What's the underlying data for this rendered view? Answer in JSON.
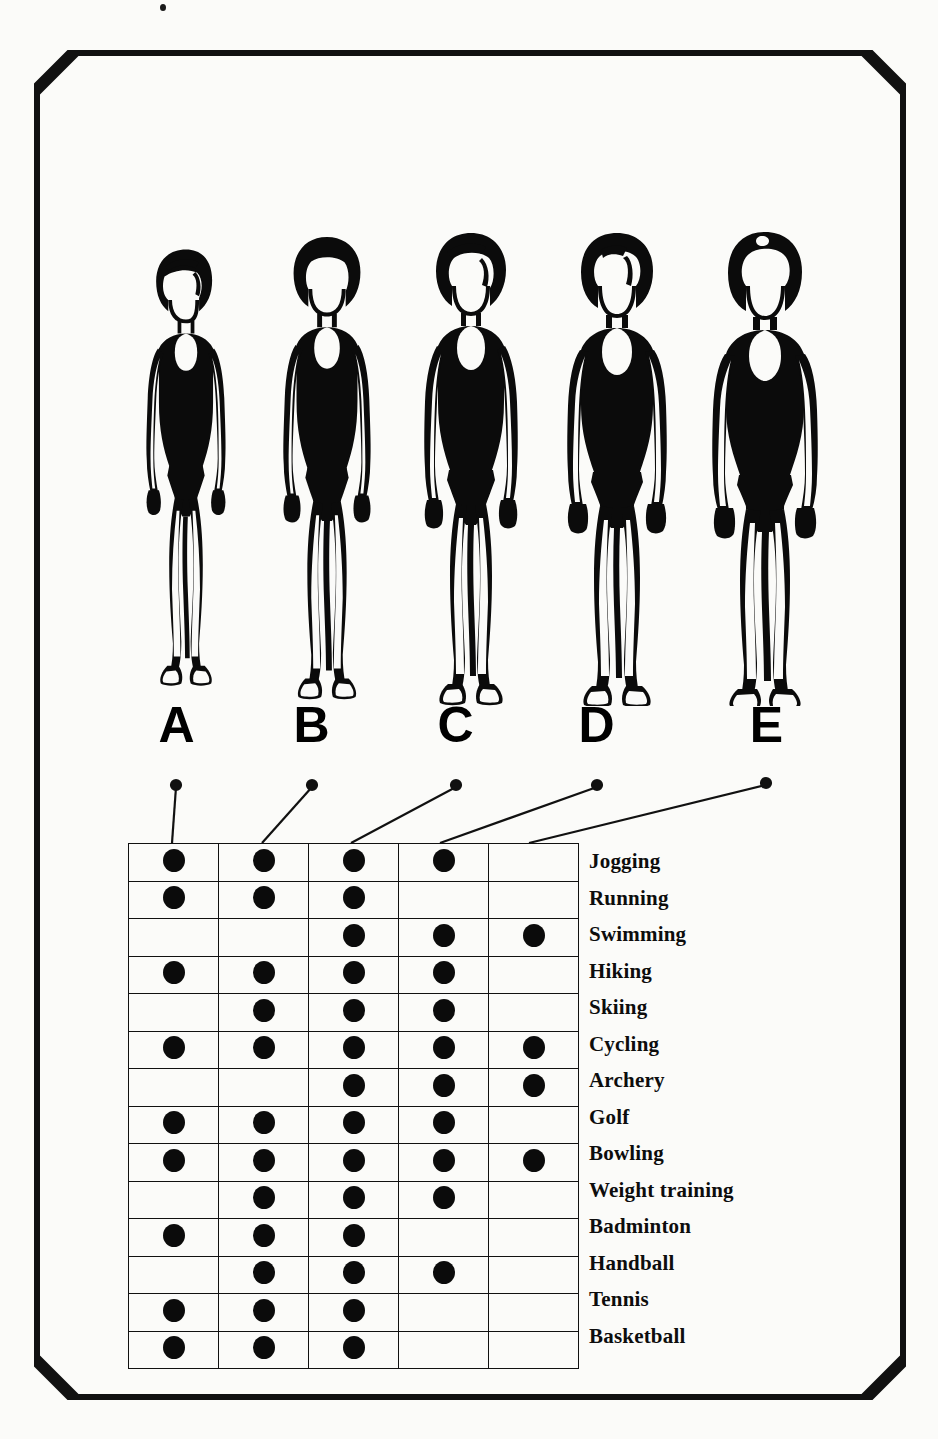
{
  "frame": {
    "border_color": "#111111",
    "background_color": "#fbfbf9",
    "border_width_px": 12,
    "bevel_px": 42
  },
  "figures": {
    "caption_note": "Five female body-type silhouettes, lean (A) to heavy (E)",
    "items": [
      {
        "id": "A",
        "label": "A",
        "icon": "body-figure-a-icon",
        "build": "very-lean",
        "scale": 1.0,
        "width_factor": 0.86
      },
      {
        "id": "B",
        "label": "B",
        "icon": "body-figure-b-icon",
        "build": "lean",
        "scale": 1.0,
        "width_factor": 0.93
      },
      {
        "id": "C",
        "label": "C",
        "icon": "body-figure-c-icon",
        "build": "average",
        "scale": 1.0,
        "width_factor": 1.0
      },
      {
        "id": "D",
        "label": "D",
        "icon": "body-figure-d-icon",
        "build": "stocky",
        "scale": 1.0,
        "width_factor": 1.09
      },
      {
        "id": "E",
        "label": "E",
        "icon": "body-figure-e-icon",
        "build": "heavy",
        "scale": 1.0,
        "width_factor": 1.2
      }
    ]
  },
  "chart_data": {
    "type": "table",
    "title": "",
    "xlabel": "",
    "ylabel": "",
    "columns": [
      "A",
      "B",
      "C",
      "D",
      "E"
    ],
    "categories": [
      "Jogging",
      "Running",
      "Swimming",
      "Hiking",
      "Skiing",
      "Cycling",
      "Archery",
      "Golf",
      "Bowling",
      "Weight training",
      "Badminton",
      "Handball",
      "Tennis",
      "Basketball"
    ],
    "marker": "filled-circle",
    "legend_position": "right",
    "grid": true,
    "rows": [
      {
        "activity": "Jogging",
        "marks": [
          1,
          1,
          1,
          1,
          0
        ]
      },
      {
        "activity": "Running",
        "marks": [
          1,
          1,
          1,
          0,
          0
        ]
      },
      {
        "activity": "Swimming",
        "marks": [
          0,
          0,
          1,
          1,
          1
        ]
      },
      {
        "activity": "Hiking",
        "marks": [
          1,
          1,
          1,
          1,
          0
        ]
      },
      {
        "activity": "Skiing",
        "marks": [
          0,
          1,
          1,
          1,
          0
        ]
      },
      {
        "activity": "Cycling",
        "marks": [
          1,
          1,
          1,
          1,
          1
        ]
      },
      {
        "activity": "Archery",
        "marks": [
          0,
          0,
          1,
          1,
          1
        ]
      },
      {
        "activity": "Golf",
        "marks": [
          1,
          1,
          1,
          1,
          0
        ]
      },
      {
        "activity": "Bowling",
        "marks": [
          1,
          1,
          1,
          1,
          1
        ]
      },
      {
        "activity": "Weight training",
        "marks": [
          0,
          1,
          1,
          1,
          0
        ]
      },
      {
        "activity": "Badminton",
        "marks": [
          1,
          1,
          1,
          0,
          0
        ]
      },
      {
        "activity": "Handball",
        "marks": [
          0,
          1,
          1,
          1,
          0
        ]
      },
      {
        "activity": "Tennis",
        "marks": [
          1,
          1,
          1,
          0,
          0
        ]
      },
      {
        "activity": "Basketball",
        "marks": [
          1,
          1,
          1,
          0,
          0
        ]
      }
    ],
    "column_totals": [
      9,
      12,
      14,
      10,
      4
    ]
  },
  "colors": {
    "ink": "#0b0b0b",
    "rule": "#111111",
    "paper": "#fbfbf9"
  }
}
